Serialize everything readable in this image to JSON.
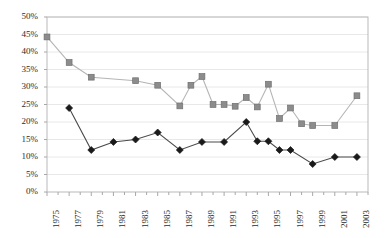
{
  "chart_data": {
    "type": "line",
    "title": "",
    "subtitle": "",
    "xlabel": "",
    "ylabel": "",
    "grid": true,
    "legend_position": "none",
    "xlim": [
      1975,
      2004
    ],
    "ylim": [
      0,
      50
    ],
    "x": [
      1975,
      1976,
      1977,
      1978,
      1979,
      1980,
      1981,
      1982,
      1983,
      1984,
      1985,
      1986,
      1987,
      1988,
      1989,
      1990,
      1991,
      1992,
      1993,
      1994,
      1995,
      1996,
      1997,
      1998,
      1999,
      2000,
      2001,
      2002,
      2003
    ],
    "y_ticks": [
      0,
      5,
      10,
      15,
      20,
      25,
      30,
      35,
      40,
      45,
      50
    ],
    "y_tick_labels": [
      "0%",
      "5%",
      "10%",
      "15%",
      "20%",
      "25%",
      "30%",
      "35%",
      "40%",
      "45%",
      "50%"
    ],
    "x_tick_labels": [
      "1975",
      "1977",
      "1979",
      "1981",
      "1983",
      "1985",
      "1987",
      "1989",
      "1991",
      "1993",
      "1995",
      "1997",
      "1999",
      "2001",
      "2003"
    ],
    "x_tick_values": [
      1975,
      1977,
      1979,
      1981,
      1983,
      1985,
      1987,
      1989,
      1991,
      1993,
      1995,
      1997,
      1999,
      2001,
      2003
    ],
    "series": [
      {
        "name": "series-gray-square",
        "marker": "square",
        "color": "#8c8c8c",
        "line_color": "#b5b5b5",
        "x": [
          1975,
          1977,
          1979,
          1983,
          1985,
          1987,
          1988,
          1989,
          1990,
          1991,
          1992,
          1993,
          1994,
          1995,
          1996,
          1997,
          1998,
          1999,
          2001,
          2003
        ],
        "values": [
          44.3,
          37.0,
          32.8,
          31.8,
          30.5,
          24.6,
          30.5,
          33.0,
          25.0,
          25.0,
          24.5,
          27.0,
          24.3,
          30.8,
          21.0,
          24.0,
          19.5,
          19.0,
          19.0,
          27.5
        ]
      },
      {
        "name": "series-black-diamond",
        "marker": "diamond",
        "color": "#1a1a1a",
        "line_color": "#4a4a4a",
        "x": [
          1977,
          1979,
          1981,
          1983,
          1985,
          1987,
          1989,
          1991,
          1993,
          1994,
          1995,
          1996,
          1997,
          1999,
          2001,
          2003
        ],
        "values": [
          24.0,
          12.0,
          14.3,
          15.0,
          17.0,
          12.0,
          14.3,
          14.3,
          20.0,
          14.5,
          14.5,
          12.0,
          12.0,
          8.0,
          10.0,
          10.0
        ]
      }
    ]
  },
  "axes": {
    "frame_color": "#b9b9b9",
    "grid_color": "#e8e8e8",
    "tick_color": "#a8a8a8",
    "label_color": "#2b2b2b"
  }
}
